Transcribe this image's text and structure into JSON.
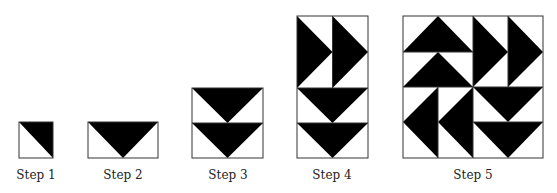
{
  "figure": {
    "fill_color": "#000000",
    "background_color": "#ffffff",
    "border_color": "#333333"
  },
  "steps": [
    {
      "label": "Step 1",
      "shape": "square, half-square triangle, black upper-right"
    },
    {
      "label": "Step 2",
      "shape": "rectangle with downward black triangle (flying goose)"
    },
    {
      "label": "Step 3",
      "shape": "two flying geese stacked pointing down"
    },
    {
      "label": "Step 4",
      "shape": "two right-pointing geese on top of two down-pointing geese"
    },
    {
      "label": "Step 5",
      "shape": "4x4 pinwheel block of flying geese"
    }
  ]
}
